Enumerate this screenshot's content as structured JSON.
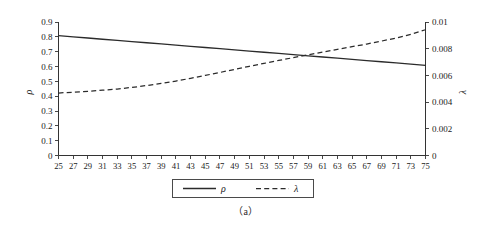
{
  "figure": {
    "caption": "（a）"
  },
  "legend": {
    "items": [
      {
        "label": "ρ",
        "style": "solid"
      },
      {
        "label": "λ",
        "style": "dashed"
      }
    ]
  },
  "chart_data": {
    "type": "line",
    "title": "",
    "xlabel": "",
    "ylabel": "ρ",
    "y2label": "λ",
    "grid": false,
    "legend_position": "bottom-center",
    "xlim": [
      25,
      75
    ],
    "ylim": [
      0,
      0.9
    ],
    "y2lim": [
      0,
      0.01
    ],
    "xticks": [
      25,
      27,
      29,
      31,
      33,
      35,
      37,
      39,
      41,
      43,
      45,
      47,
      49,
      51,
      53,
      55,
      57,
      59,
      61,
      63,
      65,
      67,
      69,
      71,
      73,
      75
    ],
    "xtick_labels": [
      "25",
      "27",
      "29",
      "31",
      "33",
      "35",
      "37",
      "39",
      "41",
      "43",
      "45",
      "47",
      "49",
      "51",
      "53",
      "55",
      "57",
      "59",
      "61",
      "63",
      "65",
      "67",
      "69",
      "71",
      "73",
      "75"
    ],
    "yticks": [
      0,
      0.1,
      0.2,
      0.3,
      0.4,
      0.5,
      0.6,
      0.7,
      0.8,
      0.9
    ],
    "ytick_labels": [
      "0",
      "0.1",
      "0.2",
      "0.3",
      "0.4",
      "0.5",
      "0.6",
      "0.7",
      "0.8",
      "0.9"
    ],
    "y2ticks": [
      0,
      0.002,
      0.004,
      0.006,
      0.008,
      0.01
    ],
    "y2tick_labels": [
      "0",
      "0.002",
      "0.004",
      "0.006",
      "0.008",
      "0.01"
    ],
    "x": [
      25,
      27,
      29,
      31,
      33,
      35,
      37,
      39,
      41,
      43,
      45,
      47,
      49,
      51,
      53,
      55,
      57,
      59,
      61,
      63,
      65,
      67,
      69,
      71,
      73,
      75
    ],
    "series": [
      {
        "name": "ρ",
        "axis": "left",
        "style": "solid",
        "color": "#2b2b2b",
        "values": [
          0.808,
          0.8,
          0.792,
          0.784,
          0.776,
          0.768,
          0.76,
          0.752,
          0.744,
          0.736,
          0.728,
          0.72,
          0.712,
          0.704,
          0.696,
          0.688,
          0.68,
          0.672,
          0.664,
          0.656,
          0.648,
          0.64,
          0.632,
          0.624,
          0.616,
          0.608
        ]
      },
      {
        "name": "λ",
        "axis": "right",
        "style": "dashed",
        "color": "#2b2b2b",
        "values": [
          0.00468,
          0.00474,
          0.00481,
          0.00489,
          0.00498,
          0.0051,
          0.00524,
          0.0054,
          0.00558,
          0.00578,
          0.006,
          0.00622,
          0.00645,
          0.00668,
          0.0069,
          0.00712,
          0.00733,
          0.00754,
          0.00775,
          0.00795,
          0.00815,
          0.00835,
          0.00857,
          0.0088,
          0.00908,
          0.00942
        ]
      }
    ]
  }
}
